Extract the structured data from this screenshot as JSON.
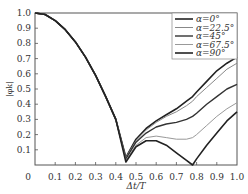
{
  "chart_data": {
    "type": "line",
    "title": "",
    "xlabel": "Δt/T",
    "ylabel": "|φk|",
    "xlim": [
      0,
      1.0
    ],
    "ylim": [
      0,
      1.0
    ],
    "grid": false,
    "legend_position": "upper right",
    "x_ticks": [
      "0",
      "0.1",
      "0.2",
      "0.3",
      "0.4",
      "0.5",
      "0.6",
      "0.7",
      "0.8",
      "0.9",
      "1.0"
    ],
    "y_ticks": [
      "0.1",
      "0.2",
      "0.3",
      "0.4",
      "0.5",
      "0.6",
      "0.7",
      "0.8",
      "0.9",
      "1.0"
    ],
    "x": [
      0,
      0.05,
      0.1,
      0.15,
      0.2,
      0.25,
      0.3,
      0.35,
      0.4,
      0.45,
      0.5,
      0.55,
      0.6,
      0.65,
      0.7,
      0.75,
      0.78,
      0.8,
      0.85,
      0.9,
      0.95,
      1.0
    ],
    "series": [
      {
        "name": "α=0°",
        "color": "#222222",
        "width": 1.6,
        "values": [
          1.0,
          0.99,
          0.95,
          0.89,
          0.81,
          0.71,
          0.59,
          0.45,
          0.3,
          0.05,
          0.17,
          0.24,
          0.29,
          0.33,
          0.37,
          0.42,
          0.45,
          0.48,
          0.55,
          0.62,
          0.67,
          0.71
        ]
      },
      {
        "name": "α=22.5°",
        "color": "#888888",
        "width": 1.0,
        "values": [
          1.0,
          0.99,
          0.95,
          0.89,
          0.81,
          0.71,
          0.59,
          0.45,
          0.3,
          0.05,
          0.16,
          0.23,
          0.28,
          0.32,
          0.35,
          0.39,
          0.42,
          0.45,
          0.51,
          0.57,
          0.63,
          0.67
        ]
      },
      {
        "name": "α=45°",
        "color": "#333333",
        "width": 1.4,
        "values": [
          1.0,
          0.99,
          0.95,
          0.89,
          0.81,
          0.71,
          0.59,
          0.45,
          0.3,
          0.04,
          0.15,
          0.21,
          0.25,
          0.27,
          0.28,
          0.3,
          0.32,
          0.34,
          0.4,
          0.45,
          0.5,
          0.53
        ]
      },
      {
        "name": "α=67.5°",
        "color": "#999999",
        "width": 1.0,
        "values": [
          1.0,
          0.99,
          0.95,
          0.89,
          0.81,
          0.71,
          0.59,
          0.45,
          0.3,
          0.03,
          0.13,
          0.18,
          0.19,
          0.18,
          0.17,
          0.17,
          0.18,
          0.2,
          0.26,
          0.32,
          0.37,
          0.41
        ]
      },
      {
        "name": "α=90°",
        "color": "#222222",
        "width": 1.6,
        "values": [
          1.0,
          0.99,
          0.95,
          0.89,
          0.81,
          0.71,
          0.59,
          0.45,
          0.3,
          0.02,
          0.12,
          0.16,
          0.16,
          0.13,
          0.08,
          0.03,
          0.0,
          0.04,
          0.13,
          0.21,
          0.29,
          0.35
        ]
      }
    ]
  }
}
